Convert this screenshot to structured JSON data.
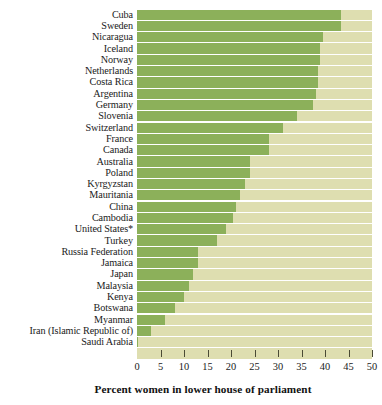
{
  "chart_data": {
    "type": "bar",
    "orientation": "horizontal",
    "title": "",
    "xlabel": "Percent women in lower house of parliament",
    "ylabel": "",
    "xlim": [
      0,
      50
    ],
    "xticks": [
      0,
      5,
      10,
      15,
      20,
      25,
      30,
      35,
      40,
      45,
      50
    ],
    "grid": false,
    "legend": "none",
    "bar_color": "#8cb05a",
    "track_color": "#dedeb0",
    "categories": [
      "Cuba",
      "Sweden",
      "Nicaragua",
      "Iceland",
      "Norway",
      "Netherlands",
      "Costa Rica",
      "Argentina",
      "Germany",
      "Slovenia",
      "Switzerland",
      "France",
      "Canada",
      "Australia",
      "Poland",
      "Kyrgyzstan",
      "Mauritania",
      "China",
      "Cambodia",
      "United States*",
      "Turkey",
      "Russia Federation",
      "Jamaica",
      "Japan",
      "Malaysia",
      "Kenya",
      "Botswana",
      "Myanmar",
      "Iran (Islamic Republic of)",
      "Saudi Arabia"
    ],
    "values": [
      43.5,
      43.5,
      39.5,
      39.0,
      39.0,
      38.5,
      38.5,
      38.0,
      37.5,
      34.0,
      31.0,
      28.0,
      28.0,
      24.0,
      24.0,
      23.0,
      22.0,
      21.0,
      20.5,
      19.0,
      17.0,
      13.0,
      13.0,
      12.0,
      11.0,
      10.0,
      8.0,
      6.0,
      3.0,
      0.2
    ]
  },
  "axis": {
    "tick_labels": [
      "0",
      "5",
      "10",
      "15",
      "20",
      "25",
      "30",
      "35",
      "40",
      "45",
      "50"
    ],
    "title": "Percent women in lower house of parliament"
  }
}
